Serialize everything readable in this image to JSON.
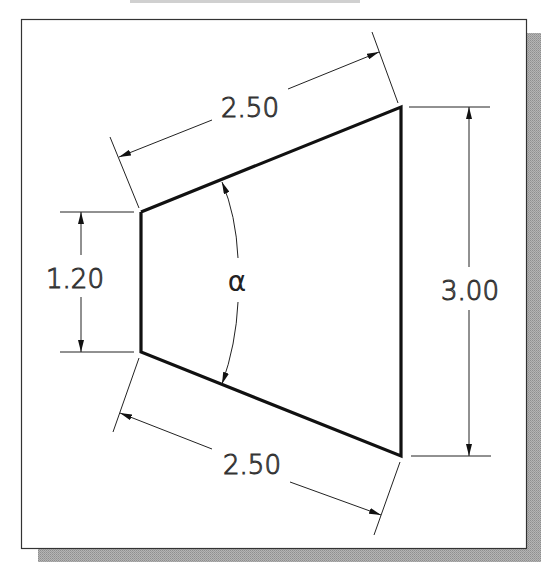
{
  "figure": {
    "type": "engineering-dimension-drawing",
    "shape": "trapezoid",
    "colors": {
      "frame_border": "#333333",
      "shadow": "#a8a8a8",
      "object_line": "#111111",
      "dimension_line": "#222222",
      "background": "#ffffff"
    }
  },
  "dimensions": {
    "top_slanted": {
      "label": "2.50"
    },
    "bottom_slanted": {
      "label": "2.50"
    },
    "left_vertical": {
      "label": "1.20"
    },
    "right_vertical": {
      "label": "3.00"
    },
    "angle": {
      "label": "α"
    }
  }
}
